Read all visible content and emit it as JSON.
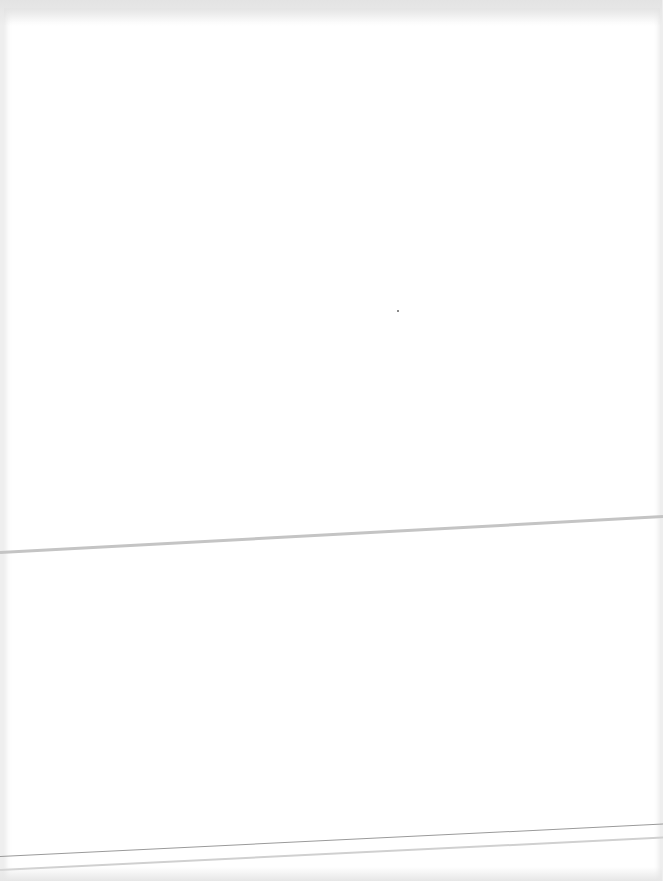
{
  "document": {
    "type": "blank scanned page",
    "text": [],
    "marks": [
      {
        "kind": "fold-line",
        "orientation": "near-horizontal"
      },
      {
        "kind": "edge-line"
      },
      {
        "kind": "edge-line"
      },
      {
        "kind": "speck"
      }
    ]
  }
}
